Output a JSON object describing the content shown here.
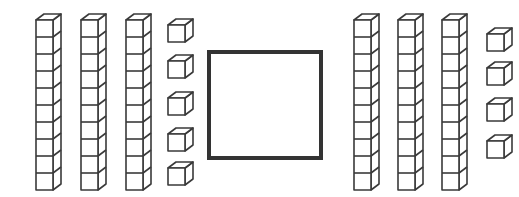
{
  "diagram": {
    "type": "base-ten-blocks",
    "left_group": {
      "tens": 3,
      "ones": 5,
      "value": 35
    },
    "answer_box": {
      "content": ""
    },
    "right_group": {
      "tens": 3,
      "ones": 4,
      "value": 34
    }
  },
  "geometry": {
    "cube": 17,
    "depth_x": 8,
    "depth_y": 6,
    "left_rods_x": [
      36,
      81,
      126
    ],
    "rod_top_y": 20,
    "left_units": {
      "x": 168,
      "ys": [
        25,
        61,
        98,
        134,
        168
      ]
    },
    "right_rods_x": [
      354,
      398,
      442
    ],
    "right_units": {
      "x": 487,
      "ys": [
        34,
        68,
        104,
        141
      ]
    },
    "box": {
      "x": 209,
      "y": 52,
      "w": 112,
      "h": 106
    }
  },
  "colors": {
    "stroke": "#3a3a3a",
    "box": "#333333",
    "background": "#ffffff"
  }
}
